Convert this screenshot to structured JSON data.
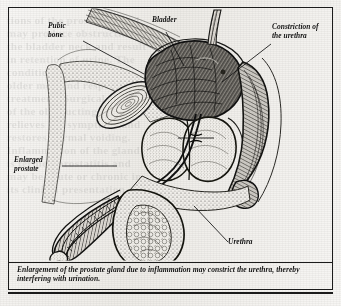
{
  "figure": {
    "kind": "anatomical-illustration",
    "view": "male pelvis, midsagittal section",
    "style": "engraved pen-and-ink halftone, black on aged paper",
    "frame_color": "#1b1b1b",
    "paper_color": "#eeece8",
    "ink_color": "#1d1d1d"
  },
  "labels": {
    "pubic_bone": "Pubic\nbone",
    "bladder": "Bladder",
    "constriction": "Constriction of\nthe urethra",
    "enlarged_prostate": "Enlarged\nprostate",
    "urethra": "Urethra"
  },
  "caption": {
    "text": "Enlargement of the prostate gland due to inflammation may constrict the urethra, thereby interfering with urination."
  },
  "ghost_text": "tions of the prostate gland\nmay produce obstruction of\nthe bladder neck and result\nin retention of urine. The\ncondition is common in\nolder men and responds to\ntreatment. Surgical removal\nof the obstructing tissue\nrelieves the symptoms and\nrestores normal voiding.\nInflammation of the gland\nis termed prostatitis and\nmay be acute or chronic in\nits clinical presentation."
}
